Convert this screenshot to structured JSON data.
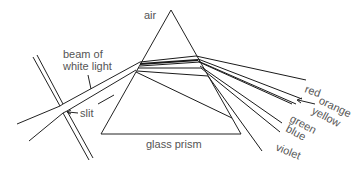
{
  "labels": {
    "air": "air",
    "beam": [
      "beam of",
      "white light"
    ],
    "slit": "slit",
    "prism": "glass prism"
  },
  "spectrum": [
    {
      "name": "red",
      "label": "red"
    },
    {
      "name": "orange",
      "label": "orange"
    },
    {
      "name": "yellow",
      "label": "yellow"
    },
    {
      "name": "green",
      "label": "green"
    },
    {
      "name": "blue",
      "label": "blue"
    },
    {
      "name": "violet",
      "label": "violet"
    }
  ],
  "colors": {
    "line": "#1a1a1a",
    "text": "#555555",
    "background": "#ffffff"
  }
}
